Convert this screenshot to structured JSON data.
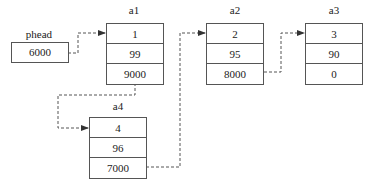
{
  "head": {
    "label": "phead",
    "value": "6000"
  },
  "nodes": [
    {
      "id": "a1",
      "label": "a1",
      "data": "1",
      "score": "99",
      "next": "9000"
    },
    {
      "id": "a2",
      "label": "a2",
      "data": "2",
      "score": "95",
      "next": "8000"
    },
    {
      "id": "a3",
      "label": "a3",
      "data": "3",
      "score": "90",
      "next": "0"
    },
    {
      "id": "a4",
      "label": "a4",
      "data": "4",
      "score": "96",
      "next": "7000"
    }
  ],
  "colors": {
    "line": "#555555",
    "background": "#ffffff"
  }
}
